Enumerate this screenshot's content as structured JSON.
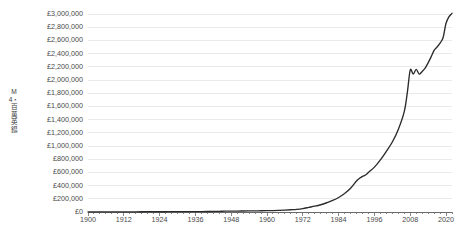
{
  "chart_data": {
    "type": "line",
    "title": "",
    "subtitle": "",
    "xlabel": "",
    "ylabel": "M4・百萬英鎉",
    "xlim": [
      1900,
      2022
    ],
    "ylim": [
      0,
      3000000
    ],
    "grid": "horizontal",
    "legend": "none",
    "series_name": "M4",
    "line_color": "#2b2b2b",
    "gridline_color": "#eaeaea",
    "axis_color": "#5a5a5a",
    "background_color": "#ffffff",
    "ytick_labels": [
      "£0",
      "£200,000",
      "£400,000",
      "£600,000",
      "£800,000",
      "£1,000,000",
      "£1,200,000",
      "£1,400,000",
      "£1,600,000",
      "£1,800,000",
      "£2,000,000",
      "£2,200,000",
      "£2,400,000",
      "£2,600,000",
      "£2,800,000",
      "£3,000,000"
    ],
    "ytick_values": [
      0,
      200000,
      400000,
      600000,
      800000,
      1000000,
      1200000,
      1400000,
      1600000,
      1800000,
      2000000,
      2200000,
      2400000,
      2600000,
      2800000,
      3000000
    ],
    "xtick_labels": [
      "1900",
      "1912",
      "1924",
      "1936",
      "1948",
      "1960",
      "1972",
      "1984",
      "1996",
      "2008",
      "2020"
    ],
    "xtick_values": [
      1900,
      1912,
      1924,
      1936,
      1948,
      1960,
      1972,
      1984,
      1996,
      2008,
      2020
    ],
    "xminor_step": 2,
    "x": [
      1900,
      1902,
      1904,
      1906,
      1908,
      1910,
      1912,
      1914,
      1916,
      1918,
      1920,
      1922,
      1924,
      1926,
      1928,
      1930,
      1932,
      1934,
      1936,
      1938,
      1940,
      1942,
      1944,
      1946,
      1948,
      1950,
      1952,
      1954,
      1956,
      1958,
      1960,
      1962,
      1964,
      1966,
      1968,
      1970,
      1972,
      1974,
      1976,
      1978,
      1980,
      1982,
      1984,
      1986,
      1988,
      1990,
      1991,
      1992,
      1993,
      1994,
      1996,
      1998,
      2000,
      2002,
      2004,
      2006,
      2007,
      2008,
      2009,
      2010,
      2011,
      2012,
      2013,
      2014,
      2015,
      2016,
      2017,
      2018,
      2019,
      2020,
      2021,
      2022
    ],
    "values": [
      1000,
      1100,
      1200,
      1300,
      1400,
      1500,
      1700,
      1900,
      2600,
      3600,
      4500,
      4300,
      4400,
      4600,
      4800,
      4900,
      5000,
      5300,
      5600,
      5900,
      7000,
      8800,
      10500,
      12500,
      13500,
      14200,
      15000,
      16000,
      17000,
      18500,
      20000,
      22000,
      25000,
      29000,
      34000,
      40000,
      52000,
      70000,
      88000,
      110000,
      140000,
      175000,
      220000,
      280000,
      360000,
      470000,
      510000,
      540000,
      560000,
      600000,
      680000,
      790000,
      920000,
      1060000,
      1250000,
      1520000,
      1800000,
      2150000,
      2090000,
      2160000,
      2090000,
      2130000,
      2180000,
      2260000,
      2350000,
      2450000,
      2500000,
      2560000,
      2640000,
      2860000,
      2960000,
      3010000
    ]
  }
}
